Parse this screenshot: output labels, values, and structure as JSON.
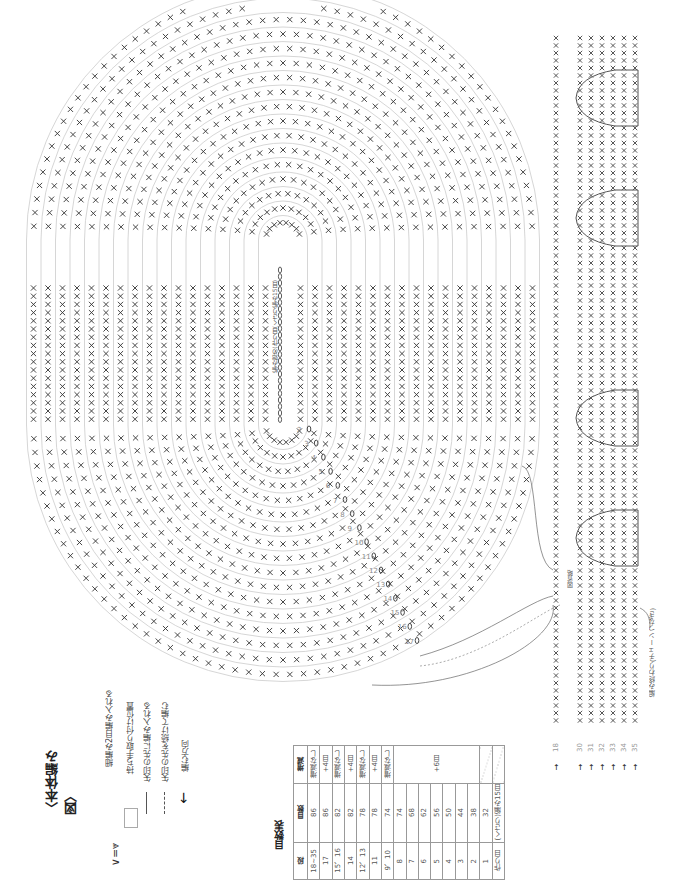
{
  "title": "〈本体編み図〉",
  "legend": {
    "items": [
      {
        "icon": "increase-icon",
        "symbol": "∨ = ⩔",
        "label": "細編み2目編み入れる"
      },
      {
        "icon": "handle-position-icon",
        "symbol": "□",
        "label": "持ち手取り付け位置"
      },
      {
        "icon": "arrow-solid-icon",
        "symbol": "→",
        "label": "矢印の先に編み入れる"
      },
      {
        "icon": "arrow-dashed-icon",
        "symbol": "⇢",
        "label": "矢印の先を続けて編む"
      },
      {
        "icon": "direction-arrow-icon",
        "symbol": "⬅",
        "label": "編む方向"
      }
    ]
  },
  "stitch_table": {
    "title": "目数表",
    "headers": [
      "段",
      "目数",
      "増減"
    ],
    "rows": [
      {
        "row": "18~35",
        "count": "86",
        "change": "増減なし"
      },
      {
        "row": "17",
        "count": "86",
        "change": "+4目"
      },
      {
        "row": "15、16",
        "count": "82",
        "change": "増減なし"
      },
      {
        "row": "14",
        "count": "82",
        "change": "+4目"
      },
      {
        "row": "12、13",
        "count": "78",
        "change": "増減なし"
      },
      {
        "row": "11",
        "count": "78",
        "change": "+4目"
      },
      {
        "row": "9、10",
        "count": "74",
        "change": "増減なし"
      },
      {
        "row": "8",
        "count": "74",
        "change": "+6目"
      },
      {
        "row": "7",
        "count": "68",
        "change": ""
      },
      {
        "row": "6",
        "count": "62",
        "change": ""
      },
      {
        "row": "5",
        "count": "56",
        "change": ""
      },
      {
        "row": "4",
        "count": "50",
        "change": ""
      },
      {
        "row": "3",
        "count": "44",
        "change": ""
      },
      {
        "row": "2",
        "count": "38",
        "change": ""
      },
      {
        "row": "1",
        "count": "32",
        "change": ""
      },
      {
        "row": "作り目",
        "count": "(くさり)編み15目",
        "change": ""
      }
    ],
    "merged_change_label": "+6目"
  },
  "diagram": {
    "foundation_label": "編み始め(作り目(くさり編み15目)",
    "round_numbers": [
      "2",
      "3",
      "4",
      "5",
      "6",
      "7",
      "8",
      "9",
      "10",
      "11",
      "12",
      "13",
      "14",
      "15",
      "16",
      "17"
    ],
    "side_rows": [
      "18",
      "30",
      "31",
      "32",
      "33",
      "34",
      "35"
    ],
    "omitted_label": "図省略",
    "end_label": "編み終わり(チェーンつなぎ)",
    "handle_markers": 4
  },
  "colors": {
    "ink": "#333333",
    "guide": "#cccccc",
    "handle": "#555555"
  }
}
